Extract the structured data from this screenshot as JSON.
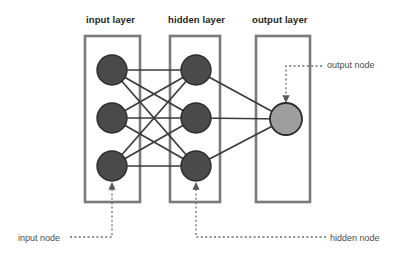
{
  "diagram": {
    "kind": "neural-network-architecture",
    "width": 403,
    "height": 255,
    "background_color": "#ffffff"
  },
  "titles": {
    "input_layer": "input layer",
    "hidden_layer": "hidden layer",
    "output_layer": "output layer"
  },
  "callouts": {
    "input_node": "input node",
    "hidden_node": "hidden node",
    "output_node": "output node"
  },
  "colors": {
    "node_fill_dark": "#4a4a4a",
    "node_fill_light": "#9e9e9e",
    "node_stroke": "#2b2b2b",
    "box_stroke": "#7a7a7a",
    "edge_stroke": "#3a3a3a",
    "callout_stroke": "#6e6e6e",
    "title_text": "#231f20",
    "callout_text": "#4d4d4d"
  },
  "layers": [
    {
      "id": "input",
      "title": "input layer",
      "box": {
        "x": 85,
        "y": 36,
        "w": 55,
        "h": 166
      },
      "node_count": 3,
      "node_radius": 15,
      "node_fill": "#4a4a4a",
      "nodes": [
        {
          "id": "i1",
          "cx": 112,
          "cy": 70
        },
        {
          "id": "i2",
          "cx": 112,
          "cy": 118
        },
        {
          "id": "i3",
          "cx": 112,
          "cy": 166
        }
      ]
    },
    {
      "id": "hidden",
      "title": "hidden layer",
      "box": {
        "x": 170,
        "y": 36,
        "w": 50,
        "h": 166
      },
      "node_count": 3,
      "node_radius": 15,
      "node_fill": "#4a4a4a",
      "nodes": [
        {
          "id": "h1",
          "cx": 196,
          "cy": 70
        },
        {
          "id": "h2",
          "cx": 196,
          "cy": 118
        },
        {
          "id": "h3",
          "cx": 196,
          "cy": 166
        }
      ]
    },
    {
      "id": "output",
      "title": "output layer",
      "box": {
        "x": 256,
        "y": 36,
        "w": 54,
        "h": 166
      },
      "node_count": 1,
      "node_radius": 16,
      "node_fill": "#9e9e9e",
      "nodes": [
        {
          "id": "o1",
          "cx": 286,
          "cy": 119
        }
      ]
    }
  ],
  "edges": {
    "input_to_hidden": [
      {
        "from": "i1",
        "to": "h1"
      },
      {
        "from": "i1",
        "to": "h2"
      },
      {
        "from": "i1",
        "to": "h3"
      },
      {
        "from": "i2",
        "to": "h1"
      },
      {
        "from": "i2",
        "to": "h2"
      },
      {
        "from": "i2",
        "to": "h3"
      },
      {
        "from": "i3",
        "to": "h1"
      },
      {
        "from": "i3",
        "to": "h2"
      },
      {
        "from": "i3",
        "to": "h3"
      }
    ],
    "hidden_to_output": [
      {
        "from": "h1",
        "to": "o1"
      },
      {
        "from": "h2",
        "to": "o1"
      },
      {
        "from": "h3",
        "to": "o1"
      }
    ],
    "stroke_width": 1.7
  },
  "annotations": [
    {
      "id": "input-node-callout",
      "label": "input node",
      "target_node": "i3",
      "path": "M 70 237 L 112 237 L 112 186",
      "label_x": 18,
      "label_y": 233
    },
    {
      "id": "hidden-node-callout",
      "label": "hidden node",
      "target_node": "h3",
      "path": "M 326 237 L 196 237 L 196 186",
      "label_x": 330,
      "label_y": 233
    },
    {
      "id": "output-node-callout",
      "label": "output node",
      "target_node": "o1",
      "path": "M 322 66 L 286 66 L 286 99",
      "label_x": 327,
      "label_y": 60
    }
  ]
}
